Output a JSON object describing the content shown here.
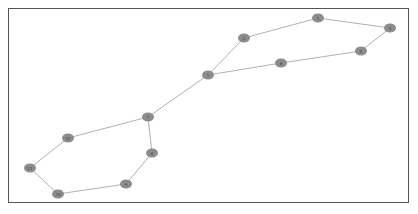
{
  "graph": {
    "node_color": "#8c8c8c",
    "edge_color": "#b0b0b0",
    "frame_color": "#555555",
    "nodes": [
      {
        "id": "1",
        "label": "1",
        "x": 208,
        "y": 75
      },
      {
        "id": "2",
        "label": "2",
        "x": 244,
        "y": 38
      },
      {
        "id": "3",
        "label": "3",
        "x": 318,
        "y": 18
      },
      {
        "id": "4",
        "label": "4",
        "x": 390,
        "y": 28
      },
      {
        "id": "5",
        "label": "5",
        "x": 361,
        "y": 51
      },
      {
        "id": "6",
        "label": "6",
        "x": 281,
        "y": 63
      },
      {
        "id": "7",
        "label": "7",
        "x": 148,
        "y": 117
      },
      {
        "id": "8",
        "label": "8",
        "x": 152,
        "y": 153
      },
      {
        "id": "9",
        "label": "9",
        "x": 126,
        "y": 184
      },
      {
        "id": "10",
        "label": "10",
        "x": 58,
        "y": 194
      },
      {
        "id": "11",
        "label": "11",
        "x": 30,
        "y": 168
      },
      {
        "id": "12",
        "label": "12",
        "x": 68,
        "y": 138
      }
    ],
    "edges": [
      [
        "1",
        "2"
      ],
      [
        "2",
        "3"
      ],
      [
        "3",
        "4"
      ],
      [
        "4",
        "5"
      ],
      [
        "5",
        "6"
      ],
      [
        "6",
        "1"
      ],
      [
        "1",
        "7"
      ],
      [
        "7",
        "8"
      ],
      [
        "8",
        "9"
      ],
      [
        "9",
        "10"
      ],
      [
        "10",
        "11"
      ],
      [
        "11",
        "12"
      ],
      [
        "12",
        "7"
      ]
    ]
  }
}
